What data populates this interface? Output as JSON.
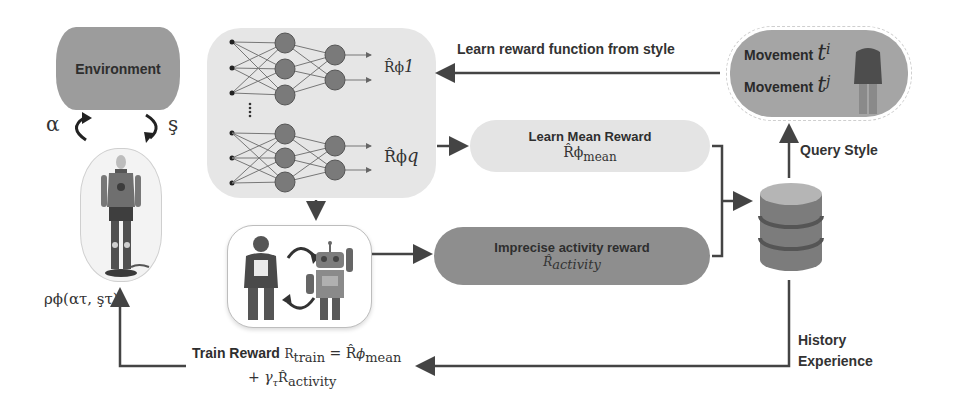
{
  "diagram": {
    "environment": {
      "label": "Environment",
      "action_symbol": "α",
      "state_symbol": "ş"
    },
    "agent": {
      "icon": "humanoid-robot-icon",
      "policy_label": "ρϕ(ατ, şτ)"
    },
    "reward_networks": {
      "outputs": [
        {
          "label": "R̂ϕ",
          "subscript": "1"
        },
        {
          "label": "R̂ϕ",
          "subscript": "q"
        }
      ],
      "ellipsis": "⋮"
    },
    "interaction": {
      "human_icon": "person-icon",
      "robot_icon": "robot-icon",
      "cycle_icon": "cycle-arrows-icon"
    },
    "mean_reward": {
      "title": "Learn Mean Reward",
      "symbol": "R̂ϕ",
      "subscript": "mean"
    },
    "activity_reward": {
      "title": "Imprecise  activity reward",
      "symbol": "R̂",
      "subscript": "activity"
    },
    "movement": {
      "lines": [
        {
          "text": "Movement",
          "var": "t",
          "sup": "i"
        },
        {
          "text": "Movement",
          "var": "t",
          "sup": "j"
        }
      ],
      "icon": "person-silhouette-icon"
    },
    "database": {
      "icon": "database-icon"
    },
    "edges": {
      "learn_reward_from_style": "Learn reward function from style",
      "query_style": "Query Style",
      "history_line1": "History",
      "history_line2": "Experience"
    },
    "train_reward": {
      "label": "Train Reward",
      "lhs": "R",
      "lhs_sub": "train",
      "eq": " = R̂",
      "phi": "ϕ",
      "mean_sub": "mean",
      "plus": "+ ",
      "gamma": "γ",
      "gamma_sub": "τ",
      "act_symbol": "R̂",
      "act_sub": "activity"
    }
  },
  "colors": {
    "environment": "#9c9c9c",
    "nn_panel": "#e6e6e6",
    "node": "#7a7a7a",
    "mean_box": "#e4e4e4",
    "activity_box": "#8e8e8e",
    "movement_box": "#a5a5a5",
    "arrow": "#444444"
  }
}
